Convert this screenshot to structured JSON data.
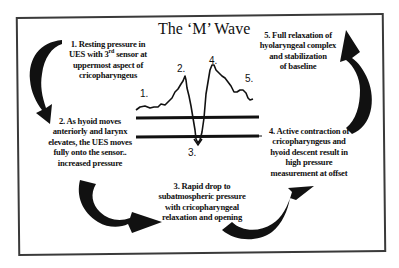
{
  "diagram": {
    "title": "The ‘M’ Wave",
    "steps": [
      {
        "id": "1",
        "text_lines": [
          "1. Resting pressure in",
          "UES with 3rd sensor at",
          "uppermost aspect of",
          "cricopharyngeus"
        ]
      },
      {
        "id": "2",
        "text_lines": [
          "2. As hyoid moves",
          "anteriorly and larynx",
          "elevates, the UES moves",
          "fully onto the sensor..",
          "increased pressure"
        ]
      },
      {
        "id": "3",
        "text_lines": [
          "3. Rapid drop to",
          "subatmospheric pressure",
          "with cricopharyngeal",
          "relaxation and opening"
        ]
      },
      {
        "id": "4",
        "text_lines": [
          "4. Active contraction of",
          "cricopharyngeus and",
          "hyoid descent result in",
          "high pressure",
          "measurement at offset"
        ]
      },
      {
        "id": "5",
        "text_lines": [
          "5. Full relaxation of",
          "hyolaryngeal complex",
          "and stabilization",
          "of baseline"
        ]
      }
    ],
    "wave_labels": [
      "1.",
      "2.",
      "3.",
      "4.",
      "5."
    ],
    "colors": {
      "ink": "#111111",
      "frame": "#3a3a3a",
      "background": "#ffffff"
    }
  }
}
